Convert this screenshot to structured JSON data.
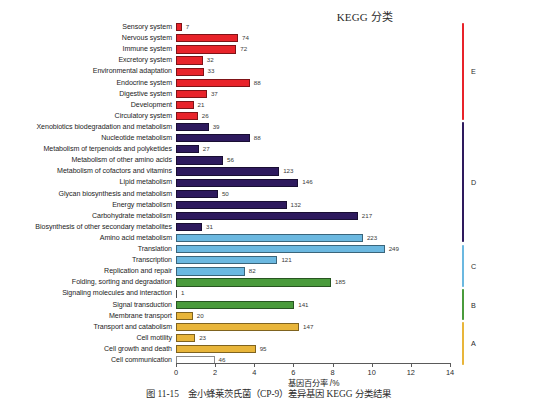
{
  "chart_data": {
    "type": "bar",
    "title": "KEGG 分类",
    "xlabel": "基因百分率 /%",
    "ylabel": "",
    "xlim": [
      0,
      14
    ],
    "xticks": [
      0,
      2,
      4,
      6,
      8,
      10,
      12,
      14
    ],
    "xtick_labels": [
      "0",
      "2",
      "4",
      "6",
      "8",
      "10",
      "12",
      "14"
    ],
    "grid": false,
    "legend_position": "right",
    "orientation": "horizontal",
    "value_unit": "gene count",
    "categories": [
      "Sensory system",
      "Nervous system",
      "Immune system",
      "Excretory system",
      "Environmental adaptation",
      "Endocrine system",
      "Digestive system",
      "Development",
      "Circulatory system",
      "Xenobiotics biodegradation and metabolism",
      "Nucleotide metabolism",
      "Metabolism of terpenoids and polyketides",
      "Metabolism of other amino acids",
      "Metabolism of cofactors and vitamins",
      "Lipid metabolism",
      "Glycan biosynthesis and metabolism",
      "Energy metabolism",
      "Carbohydrate metabolism",
      "Biosynthesis of other secondary metabolites",
      "Amino acid metabolism",
      "Translation",
      "Transcription",
      "Replication and repair",
      "Folding, sorting and degradation",
      "Signaling molecules and interaction",
      "Signal transduction",
      "Membrane transport",
      "Transport and catabolism",
      "Cell motility",
      "Cell growth and death",
      "Cell communication"
    ],
    "counts": [
      7,
      74,
      72,
      32,
      33,
      88,
      37,
      21,
      26,
      39,
      88,
      27,
      56,
      123,
      146,
      50,
      132,
      217,
      31,
      223,
      249,
      121,
      82,
      185,
      1,
      141,
      20,
      147,
      23,
      95,
      46
    ],
    "percents": [
      0.3,
      3.17,
      3.08,
      1.37,
      1.41,
      3.77,
      1.58,
      0.9,
      1.11,
      1.67,
      3.77,
      1.16,
      2.4,
      5.27,
      6.25,
      2.14,
      5.65,
      9.29,
      1.33,
      9.55,
      10.66,
      5.18,
      3.51,
      7.92,
      0.05,
      6.04,
      0.86,
      6.29,
      0.98,
      4.07,
      1.97
    ],
    "group_of_category": [
      "E",
      "E",
      "E",
      "E",
      "E",
      "E",
      "E",
      "E",
      "E",
      "D",
      "D",
      "D",
      "D",
      "D",
      "D",
      "D",
      "D",
      "D",
      "D",
      "C",
      "C",
      "C",
      "C",
      "B",
      "B",
      "B",
      "A",
      "A",
      "A",
      "A"
    ],
    "groups": [
      {
        "label": "E",
        "color": "#E8232A",
        "first": 0,
        "last": 8
      },
      {
        "label": "D",
        "color": "#2E1A5E",
        "first": 9,
        "last": 19
      },
      {
        "label": "C",
        "color": "#6BB8E0",
        "first": 20,
        "last": 23
      },
      {
        "label": "B",
        "color": "#4A9B3C",
        "first": 24,
        "last": 26
      },
      {
        "label": "A",
        "color": "#E8B53A",
        "first": 27,
        "last": 30
      }
    ]
  },
  "caption": "图 11-15　金小蜂莱茨氏菌（CP-9）差异基因 KEGG 分类结果"
}
